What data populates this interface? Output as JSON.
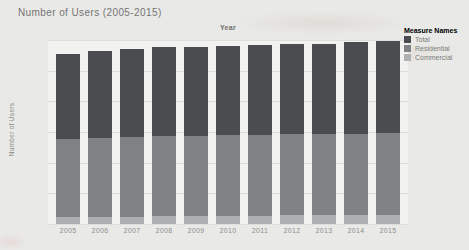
{
  "chart_data": {
    "type": "bar",
    "stacked": true,
    "title": "Number of Users (2005-2015)",
    "xlabel": "Year",
    "ylabel": "Number of Users",
    "unit": "M",
    "ylim": [
      0,
      300
    ],
    "yticks": [
      "0M",
      "50M",
      "100M",
      "150M",
      "200M",
      "250M",
      "300M"
    ],
    "grid": true,
    "legend_title": "Measure Names",
    "legend_position": "top-right",
    "legend_order": [
      "Total",
      "Residential",
      "Commercial"
    ],
    "categories": [
      "2005",
      "2006",
      "2007",
      "2008",
      "2009",
      "2010",
      "2011",
      "2012",
      "2013",
      "2014",
      "2015"
    ],
    "series": [
      {
        "name": "Commercial",
        "color": "#aeafb1",
        "values": [
          12,
          12,
          12,
          13,
          13,
          13,
          13,
          14,
          14,
          14,
          15
        ]
      },
      {
        "name": "Residential",
        "color": "#808183",
        "values": [
          127,
          129,
          130,
          131,
          131,
          132,
          132,
          132,
          132,
          133,
          133
        ]
      },
      {
        "name": "Total",
        "color": "#4a4c50",
        "values": [
          139,
          141,
          143,
          144,
          145,
          146,
          147,
          147,
          148,
          149,
          150
        ]
      }
    ],
    "stacked_bar_totals": [
      278,
      282,
      285,
      288,
      289,
      291,
      292,
      293,
      294,
      296,
      298
    ]
  }
}
